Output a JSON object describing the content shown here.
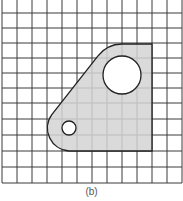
{
  "figure": {
    "caption": "(b)",
    "grid": {
      "columns": 12,
      "rows": 12,
      "x_lines": [
        2,
        17,
        32,
        47,
        62,
        77,
        92,
        107,
        122,
        137,
        152,
        167,
        182
      ],
      "y_lines": [
        13,
        28,
        43,
        58,
        73,
        88,
        103,
        119,
        135,
        151,
        167,
        183
      ],
      "line_color": "#3a3a3a"
    },
    "part": {
      "description": "Shaded plate with one large hole and one small hole",
      "fill_color": "#d4d4d4",
      "outline_color": "#222222",
      "large_hole": {
        "cx": 122,
        "cy": 75,
        "r": 19
      },
      "small_hole": {
        "cx": 69,
        "cy": 128,
        "r": 7
      }
    }
  }
}
